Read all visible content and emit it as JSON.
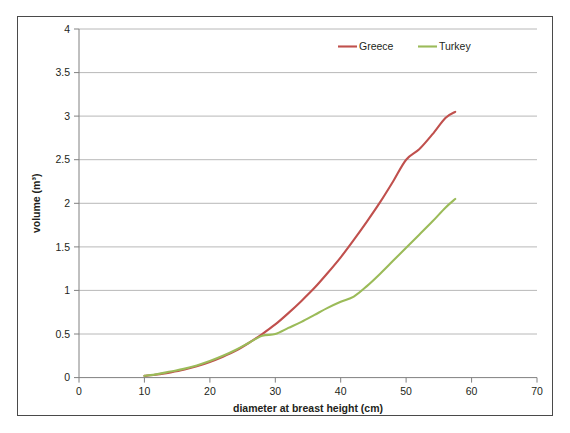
{
  "chart_data": {
    "type": "line",
    "title": "",
    "xlabel": "diameter at breast height (cm)",
    "ylabel": "volume (m³)",
    "xlim": [
      0,
      70
    ],
    "ylim": [
      0,
      4
    ],
    "x_ticks": [
      "0",
      "10",
      "20",
      "30",
      "40",
      "50",
      "60",
      "70"
    ],
    "y_ticks": [
      "0",
      "0.5",
      "1",
      "1.5",
      "2",
      "2.5",
      "3",
      "3.5",
      "4"
    ],
    "grid": "horizontal",
    "legend_position": "top-right-inside",
    "series": [
      {
        "name": "Greece",
        "color": "#c0504d",
        "x": [
          10,
          12,
          14,
          16,
          18,
          20,
          22,
          24,
          26,
          28,
          30,
          32,
          34,
          36,
          38,
          40,
          42,
          44,
          46,
          48,
          50,
          52,
          54,
          56,
          57.5
        ],
        "values": [
          0.02,
          0.035,
          0.06,
          0.09,
          0.13,
          0.18,
          0.24,
          0.31,
          0.4,
          0.5,
          0.61,
          0.74,
          0.88,
          1.03,
          1.2,
          1.38,
          1.58,
          1.79,
          2.01,
          2.25,
          2.5,
          2.62,
          2.79,
          2.98,
          3.05
        ]
      },
      {
        "name": "Turkey",
        "color": "#9bbb59",
        "x": [
          10,
          12,
          14,
          16,
          18,
          20,
          22,
          24,
          26,
          28,
          30,
          32,
          34,
          36,
          38,
          40,
          42,
          44,
          46,
          48,
          50,
          52,
          54,
          56,
          57.5
        ],
        "values": [
          0.02,
          0.04,
          0.07,
          0.1,
          0.14,
          0.19,
          0.25,
          0.32,
          0.4,
          0.48,
          0.5,
          0.57,
          0.64,
          0.72,
          0.8,
          0.87,
          0.93,
          1.05,
          1.19,
          1.34,
          1.49,
          1.64,
          1.79,
          1.95,
          2.05
        ]
      }
    ]
  },
  "legend": {
    "items": [
      {
        "label": "Greece",
        "color": "#c0504d"
      },
      {
        "label": "Turkey",
        "color": "#9bbb59"
      }
    ]
  },
  "colors": {
    "greece": "#c0504d",
    "turkey": "#9bbb59",
    "grid": "#a6a6a6",
    "axis": "#808080",
    "frame": "#4a4a4a",
    "text": "#231f20"
  }
}
